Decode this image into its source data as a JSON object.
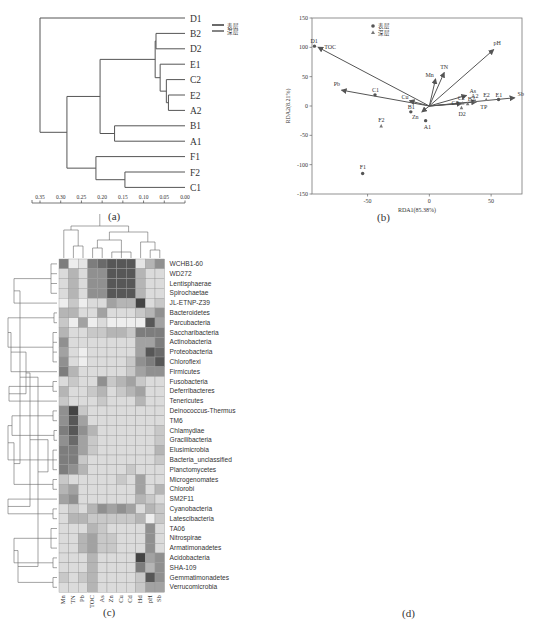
{
  "figure": {
    "captions": {
      "a": "(a)",
      "b": "(b)",
      "c": "(c)",
      "d": "(d)"
    }
  },
  "chart_data": [
    {
      "panel": "a",
      "type": "dendrogram",
      "title": "",
      "leaves": [
        "D1",
        "B2",
        "D2",
        "E1",
        "C2",
        "E2",
        "A2",
        "B1",
        "A1",
        "F1",
        "F2",
        "C1"
      ],
      "legend": [
        {
          "label": "表层",
          "color": "#444444"
        },
        {
          "label": "深层",
          "color": "#666666"
        }
      ],
      "axis": {
        "ticks": [
          "0.35",
          "0.30",
          "0.25",
          "0.20",
          "0.15",
          "0.10",
          "0.05",
          "0.00"
        ],
        "range": [
          0.36,
          0.0
        ]
      },
      "merges": [
        {
          "a": "E2",
          "b": "A2",
          "height": 0.04
        },
        {
          "a": "C2",
          "b": "E2+A2",
          "height": 0.045
        },
        {
          "a": "E1",
          "b": "C2+E2+A2",
          "height": 0.06
        },
        {
          "a": "B2",
          "b": "D2",
          "height": 0.07
        },
        {
          "a": "B2+D2",
          "b": "E1+C2+E2+A2",
          "height": 0.07
        },
        {
          "a": "B1",
          "b": "A1",
          "height": 0.17
        },
        {
          "a": "B2..A2",
          "b": "B1+A1",
          "height": 0.205
        },
        {
          "a": "F2",
          "b": "C1",
          "height": 0.145
        },
        {
          "a": "F1",
          "b": "F2+C1",
          "height": 0.215
        },
        {
          "a": "B2..A1",
          "b": "F1+F2+C1",
          "height": 0.285
        },
        {
          "a": "D1",
          "b": "rest",
          "height": 0.35
        }
      ]
    },
    {
      "panel": "b",
      "type": "scatter",
      "title": "",
      "xlabel": "RDA1(85.38%)",
      "ylabel": "RDA2(8.21%)",
      "xlim": [
        -95,
        75
      ],
      "ylim": [
        -150,
        150
      ],
      "xticks": [
        "-50",
        "0",
        "50"
      ],
      "yticks": [
        "150",
        "100",
        "50",
        "0",
        "-50",
        "-100",
        "-150"
      ],
      "legend": [
        {
          "label": "表层",
          "marker": "circle"
        },
        {
          "label": "深层",
          "marker": "triangle"
        }
      ],
      "points": [
        {
          "label": "D1",
          "x": -93,
          "y": 102,
          "layer": "表层"
        },
        {
          "label": "C1",
          "x": -44,
          "y": 19,
          "layer": "表层"
        },
        {
          "label": "B1",
          "x": -15,
          "y": -10,
          "layer": "表层"
        },
        {
          "label": "A1",
          "x": -3,
          "y": -25,
          "layer": "表层"
        },
        {
          "label": "F1",
          "x": -54,
          "y": -115,
          "layer": "表层"
        },
        {
          "label": "E1",
          "x": 56,
          "y": 11,
          "layer": "表层"
        },
        {
          "label": "F2",
          "x": -39,
          "y": -34,
          "layer": "深层"
        },
        {
          "label": "C2",
          "x": 27,
          "y": 5,
          "layer": "深层"
        },
        {
          "label": "B2",
          "x": 31,
          "y": 4,
          "layer": "深层"
        },
        {
          "label": "D2",
          "x": 26,
          "y": -3,
          "layer": "深层"
        },
        {
          "label": "A2",
          "x": 37,
          "y": 9,
          "layer": "深层"
        },
        {
          "label": "E2",
          "x": 46,
          "y": 11,
          "layer": "深层"
        }
      ],
      "vectors": [
        {
          "label": "TOC",
          "x": -90,
          "y": 100
        },
        {
          "label": "Pb",
          "x": -71,
          "y": 27
        },
        {
          "label": "Cu",
          "x": -16,
          "y": 9
        },
        {
          "label": "Zn",
          "x": -6,
          "y": -10
        },
        {
          "label": "Mn",
          "x": 5,
          "y": 46
        },
        {
          "label": "TN",
          "x": 12,
          "y": 57
        },
        {
          "label": "pH",
          "x": 52,
          "y": 96
        },
        {
          "label": "As",
          "x": 30,
          "y": 18
        },
        {
          "label": "Cd",
          "x": 26,
          "y": 4
        },
        {
          "label": "TP",
          "x": 38,
          "y": 7
        },
        {
          "label": "Sb",
          "x": 69,
          "y": 14
        }
      ]
    },
    {
      "panel": "c",
      "type": "heatmap",
      "title": "",
      "colorbar": {
        "ticks": [
          "0.5",
          "0",
          "-0.5"
        ],
        "range": [
          -0.8,
          0.8
        ]
      },
      "columns": [
        "Mn",
        "TN",
        "Pb",
        "TOC",
        "As",
        "Zn",
        "Cu",
        "Cd",
        "Hd",
        "pH",
        "Sb"
      ],
      "rows": [
        "WCHB1-60",
        "WD272",
        "Lentisphaerae",
        "Spirochaetae",
        "JL-ETNP-Z39",
        "Bacteroidetes",
        "Parcubacteria",
        "Saccharibacteria",
        "Actinobacteria",
        "Proteobacteria",
        "Chloroflexi",
        "Firmicutes",
        "Fusobacteria",
        "Deferribacteres",
        "Tenericutes",
        "Deinococcus-Thermus",
        "TM6",
        "Chlamydiae",
        "Gracilibacteria",
        "Elusimicrobia",
        "Bacteria_unclassified",
        "Planctomycetes",
        "Microgenomates",
        "Chlorobi",
        "SM2F11",
        "Cyanobacteria",
        "Latescibacteria",
        "TA06",
        "Nitrospirae",
        "Armatimonadetes",
        "Acidobacteria",
        "SHA-109",
        "Gemmatimonadetes",
        "Verrucomicrobia"
      ],
      "values": [
        [
          0.6,
          0.0,
          0.05,
          0.6,
          0.7,
          0.8,
          0.8,
          0.8,
          0.05,
          0.3,
          0.5
        ],
        [
          0.1,
          0.3,
          0.1,
          0.5,
          0.5,
          0.8,
          0.8,
          0.8,
          0.3,
          0.1,
          0.1
        ],
        [
          0.1,
          0.3,
          0.1,
          0.5,
          0.5,
          0.8,
          0.8,
          0.8,
          0.3,
          0.1,
          0.1
        ],
        [
          0.1,
          0.3,
          0.1,
          0.5,
          0.5,
          0.8,
          0.8,
          0.8,
          0.3,
          0.1,
          0.1
        ],
        [
          0.0,
          0.2,
          0.0,
          0.1,
          0.1,
          0.4,
          0.3,
          0.3,
          0.9,
          0.1,
          0.2
        ],
        [
          0.3,
          0.3,
          0.1,
          0.1,
          0.4,
          0.1,
          0.1,
          0.1,
          0.2,
          0.3,
          0.5
        ],
        [
          0.2,
          0.0,
          0.4,
          0.0,
          0.1,
          0.0,
          0.0,
          0.0,
          0.0,
          0.8,
          0.4
        ],
        [
          0.3,
          0.1,
          0.1,
          0.2,
          0.2,
          0.3,
          0.3,
          0.2,
          0.6,
          0.6,
          0.6
        ],
        [
          0.5,
          0.1,
          0.1,
          0.1,
          0.1,
          0.1,
          0.1,
          0.1,
          0.4,
          0.4,
          0.6
        ],
        [
          0.4,
          0.1,
          0.0,
          0.1,
          0.1,
          0.1,
          0.1,
          0.1,
          0.4,
          0.8,
          0.7
        ],
        [
          0.5,
          0.1,
          0.0,
          0.1,
          0.1,
          0.1,
          0.1,
          0.2,
          0.5,
          0.6,
          0.8
        ],
        [
          0.6,
          0.3,
          0.1,
          0.1,
          0.1,
          0.1,
          0.1,
          0.2,
          0.4,
          0.5,
          0.5
        ],
        [
          0.1,
          0.2,
          0.1,
          0.1,
          0.5,
          0.2,
          0.3,
          0.4,
          0.2,
          0.1,
          0.1
        ],
        [
          0.3,
          0.1,
          0.1,
          0.2,
          0.3,
          0.1,
          0.2,
          0.3,
          0.4,
          0.1,
          0.1
        ],
        [
          0.2,
          0.1,
          0.1,
          0.1,
          0.2,
          0.1,
          0.1,
          0.1,
          0.3,
          0.1,
          0.1
        ],
        [
          0.5,
          0.9,
          0.2,
          0.1,
          0.1,
          0.1,
          0.1,
          0.1,
          0.1,
          0.1,
          0.1
        ],
        [
          0.5,
          0.8,
          0.4,
          0.1,
          0.1,
          0.1,
          0.1,
          0.1,
          0.1,
          0.1,
          0.1
        ],
        [
          0.6,
          0.8,
          0.5,
          0.3,
          0.1,
          0.1,
          0.1,
          0.1,
          0.1,
          0.1,
          0.2
        ],
        [
          0.5,
          0.7,
          0.4,
          0.2,
          0.1,
          0.1,
          0.1,
          0.1,
          0.1,
          0.1,
          0.2
        ],
        [
          0.6,
          0.6,
          0.4,
          0.2,
          0.1,
          0.1,
          0.1,
          0.1,
          0.1,
          0.1,
          0.3
        ],
        [
          0.6,
          0.6,
          0.2,
          0.1,
          0.1,
          0.1,
          0.1,
          0.1,
          0.1,
          0.1,
          0.2
        ],
        [
          0.6,
          0.5,
          0.3,
          0.1,
          0.1,
          0.1,
          0.1,
          0.2,
          0.1,
          0.1,
          0.1
        ],
        [
          0.2,
          0.1,
          0.1,
          0.1,
          0.1,
          0.1,
          0.2,
          0.1,
          0.4,
          0.1,
          0.1
        ],
        [
          0.3,
          0.4,
          0.1,
          0.1,
          0.1,
          0.1,
          0.1,
          0.1,
          0.4,
          0.1,
          0.3
        ],
        [
          0.4,
          0.5,
          0.1,
          0.1,
          0.1,
          0.1,
          0.1,
          0.1,
          0.3,
          0.2,
          0.1
        ],
        [
          0.1,
          0.2,
          0.1,
          0.3,
          0.5,
          0.4,
          0.5,
          0.4,
          0.1,
          0.3,
          0.2
        ],
        [
          0.1,
          0.3,
          0.3,
          0.2,
          0.2,
          0.2,
          0.2,
          0.2,
          0.3,
          0.0,
          0.2
        ],
        [
          0.1,
          0.1,
          0.1,
          0.3,
          0.2,
          0.1,
          0.1,
          0.1,
          0.1,
          0.5,
          0.1
        ],
        [
          0.1,
          0.1,
          0.3,
          0.4,
          0.2,
          0.2,
          0.1,
          0.1,
          0.1,
          0.5,
          0.1
        ],
        [
          0.1,
          0.1,
          0.3,
          0.4,
          0.2,
          0.2,
          0.1,
          0.1,
          0.1,
          0.5,
          0.1
        ],
        [
          0.1,
          0.1,
          0.1,
          0.3,
          0.1,
          0.1,
          0.1,
          0.1,
          0.9,
          0.4,
          0.5
        ],
        [
          0.1,
          0.1,
          0.1,
          0.3,
          0.1,
          0.1,
          0.1,
          0.1,
          0.6,
          0.3,
          0.5
        ],
        [
          0.2,
          0.1,
          0.2,
          0.3,
          0.1,
          0.1,
          0.1,
          0.1,
          0.2,
          0.8,
          0.5
        ],
        [
          0.1,
          0.1,
          0.1,
          0.3,
          0.1,
          0.1,
          0.1,
          0.1,
          0.2,
          0.4,
          0.4
        ]
      ]
    },
    {
      "panel": "d",
      "type": "heatmap",
      "title": "",
      "colorbar": {
        "ticks": [
          "0.5",
          "0",
          "-0.5"
        ],
        "range": [
          -0.8,
          0.8
        ]
      },
      "columns": [
        "Pb",
        "TOC",
        "Sb",
        "TN",
        "TP",
        "pH",
        "Cu",
        "Zn",
        "Mn",
        "As",
        "Cd"
      ],
      "rows": [
        "Parcubacteria",
        "Proteobacteria",
        "Deinococcus-Thermus",
        "Chlamydiae",
        "Elusimicrobia",
        "Saccharibacteria",
        "SHA-109",
        "WD272",
        "TA06",
        "WCHB1-60",
        "Planctomycetes",
        "Latescibacteria",
        "Chloroflexi",
        "Chlorobi",
        "Acidobacteria",
        "Gemmatimonadetes",
        "Actinobacteria",
        "Microgenomates",
        "SM2F11",
        "Nitrospirae",
        "TM6",
        "Verrucomicrobia",
        "Bacteria_unclassified",
        "Bacteroidetes",
        "Tenericutes",
        "Cyanobacteria",
        "Spirochaetae",
        "Gracilibacteria",
        "Deferribacteres",
        "JL-ETNP-Z39",
        "Firmicutes",
        "Fusobacteria"
      ],
      "values": [
        [
          0.8,
          0.3,
          0.5,
          0.1,
          0.1,
          0.1,
          0.1,
          0.4,
          0.3,
          0.2,
          0.2
        ],
        [
          0.85,
          0.1,
          0.1,
          0.1,
          0.1,
          0.4,
          0.5,
          0.1,
          0.1,
          0.1,
          0.1
        ],
        [
          0.85,
          0.1,
          0.1,
          0.1,
          0.1,
          0.4,
          0.5,
          0.1,
          0.1,
          0.1,
          0.1
        ],
        [
          0.85,
          0.1,
          0.1,
          0.1,
          0.1,
          0.4,
          0.5,
          0.1,
          0.1,
          0.1,
          0.1
        ],
        [
          0.85,
          0.1,
          0.1,
          0.1,
          0.1,
          0.4,
          0.5,
          0.1,
          0.1,
          0.1,
          0.1
        ],
        [
          0.85,
          0.1,
          0.1,
          0.1,
          0.1,
          0.4,
          0.5,
          0.1,
          0.1,
          0.1,
          0.1
        ],
        [
          0.85,
          0.1,
          0.1,
          0.1,
          0.1,
          0.4,
          0.5,
          0.1,
          0.1,
          0.1,
          0.1
        ],
        [
          0.85,
          0.1,
          0.1,
          0.1,
          0.1,
          0.4,
          0.5,
          0.1,
          0.1,
          0.1,
          0.1
        ],
        [
          0.85,
          0.1,
          0.1,
          0.1,
          0.1,
          0.4,
          0.5,
          0.1,
          0.1,
          0.1,
          0.1
        ],
        [
          0.85,
          0.1,
          0.1,
          0.1,
          0.1,
          0.4,
          0.5,
          0.1,
          0.1,
          0.1,
          0.1
        ],
        [
          0.85,
          0.1,
          0.1,
          0.1,
          0.1,
          0.4,
          0.5,
          0.1,
          0.1,
          0.1,
          0.1
        ],
        [
          0.85,
          0.1,
          0.1,
          0.1,
          0.1,
          0.4,
          0.5,
          0.1,
          0.1,
          0.1,
          0.1
        ],
        [
          0.85,
          0.1,
          0.1,
          0.1,
          0.1,
          0.4,
          0.5,
          0.1,
          0.1,
          0.1,
          0.1
        ],
        [
          0.85,
          0.1,
          0.1,
          0.1,
          0.1,
          0.4,
          0.5,
          0.1,
          0.1,
          0.1,
          0.1
        ],
        [
          0.85,
          0.1,
          0.1,
          0.1,
          0.1,
          0.4,
          0.5,
          0.1,
          0.1,
          0.1,
          0.1
        ],
        [
          0.85,
          0.1,
          0.1,
          0.1,
          0.1,
          0.4,
          0.5,
          0.1,
          0.1,
          0.1,
          0.1
        ],
        [
          0.85,
          0.2,
          0.2,
          0.1,
          0.1,
          0.3,
          0.4,
          0.1,
          0.1,
          0.1,
          0.1
        ],
        [
          0.85,
          0.2,
          0.2,
          0.1,
          0.1,
          0.3,
          0.4,
          0.1,
          0.1,
          0.1,
          0.1
        ],
        [
          0.85,
          0.3,
          0.3,
          0.1,
          0.1,
          0.3,
          0.4,
          0.1,
          0.1,
          0.1,
          0.1
        ],
        [
          0.85,
          0.3,
          0.3,
          0.1,
          0.1,
          0.3,
          0.4,
          0.1,
          0.1,
          0.1,
          0.1
        ],
        [
          0.85,
          0.2,
          0.2,
          0.1,
          0.1,
          0.3,
          0.4,
          0.1,
          0.1,
          0.1,
          0.1
        ],
        [
          0.85,
          0.2,
          0.2,
          0.1,
          0.1,
          0.3,
          0.4,
          0.1,
          0.1,
          0.1,
          0.1
        ],
        [
          0.5,
          0.4,
          0.1,
          0.1,
          0.4,
          0.5,
          0.1,
          0.1,
          0.4,
          0.4,
          0.3
        ],
        [
          0.3,
          0.2,
          0.1,
          0.1,
          0.2,
          0.1,
          0.2,
          0.1,
          0.3,
          0.2,
          0.2
        ],
        [
          0.4,
          0.1,
          0.2,
          0.1,
          0.9,
          0.3,
          0.3,
          0.1,
          0.2,
          0.2,
          0.1
        ],
        [
          0.0,
          0.6,
          0.8,
          0.5,
          0.5,
          0.4,
          0.6,
          0.9,
          0.4,
          0.6,
          0.5
        ],
        [
          0.0,
          0.7,
          0.8,
          0.5,
          0.4,
          0.5,
          0.5,
          0.9,
          0.3,
          0.6,
          0.5
        ],
        [
          0.5,
          0.1,
          0.1,
          0.5,
          0.4,
          0.1,
          0.1,
          0.2,
          0.4,
          0.1,
          0.1
        ],
        [
          0.2,
          0.1,
          0.2,
          0.5,
          0.1,
          0.1,
          0.2,
          0.3,
          0.2,
          0.1,
          0.1
        ],
        [
          0.1,
          0.1,
          0.2,
          0.4,
          0.2,
          0.1,
          0.1,
          0.1,
          0.1,
          0.5,
          0.5
        ],
        [
          0.6,
          0.4,
          0.3,
          0.1,
          0.1,
          0.4,
          0.4,
          0.1,
          0.2,
          0.3,
          0.2
        ],
        [
          0.5,
          0.2,
          0.2,
          0.1,
          0.1,
          0.4,
          0.4,
          0.1,
          0.1,
          0.2,
          0.2
        ]
      ]
    }
  ]
}
